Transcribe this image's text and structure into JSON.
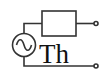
{
  "diagram": {
    "type": "circuit",
    "label": "Th",
    "components": [
      {
        "kind": "ac-voltage-source",
        "icon": "sine-wave"
      },
      {
        "kind": "impedance",
        "shape": "rectangle"
      },
      {
        "kind": "terminal",
        "position": "top"
      },
      {
        "kind": "terminal",
        "position": "bottom"
      }
    ],
    "colors": {
      "stroke": "#333333",
      "background": "#ffffff",
      "text": "#111111"
    }
  }
}
